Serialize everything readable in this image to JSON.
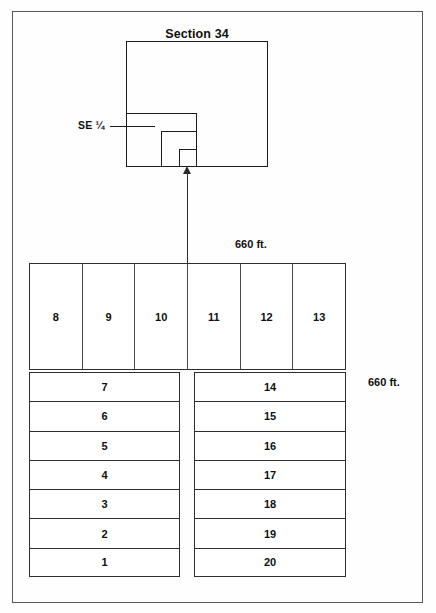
{
  "diagram": {
    "title": "Section 34",
    "quarter_label": "SE ¼",
    "dimension_top": "660 ft.",
    "dimension_right": "660 ft."
  },
  "strip_row": {
    "lots": [
      "8",
      "9",
      "10",
      "11",
      "12",
      "13"
    ]
  },
  "stacks": {
    "left": [
      "7",
      "6",
      "5",
      "4",
      "3",
      "2",
      "1"
    ],
    "right": [
      "14",
      "15",
      "16",
      "17",
      "18",
      "19",
      "20"
    ]
  }
}
